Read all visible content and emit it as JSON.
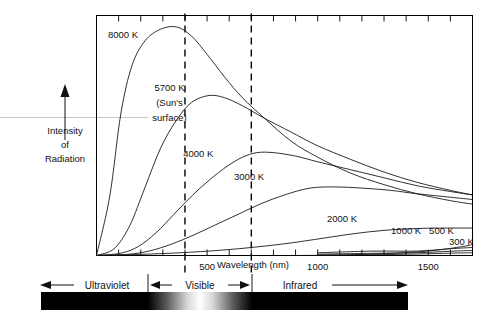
{
  "figure": {
    "y_axis_label_lines": [
      "Intensity",
      "of",
      "Radiation"
    ],
    "x_axis_label": "Wavelength (nm)"
  },
  "chart_data": {
    "type": "line",
    "title": "",
    "xlabel": "Wavelength (nm)",
    "ylabel": "Intensity of Radiation",
    "xlim": [
      0,
      1700
    ],
    "ylim": [
      0,
      1.05
    ],
    "grid": false,
    "legend": "inline-annotations",
    "x_ticks": [
      0,
      100,
      200,
      300,
      400,
      500,
      600,
      700,
      800,
      900,
      1000,
      1100,
      1200,
      1300,
      1400,
      1500,
      1600
    ],
    "x_tick_labels": [
      "",
      "",
      "",
      "",
      "",
      "500",
      "",
      "",
      "",
      "",
      "1000",
      "",
      "",
      "",
      "",
      "1500",
      ""
    ],
    "top_axis_ticks": true,
    "y_ticks": [],
    "visible_band_nm": [
      400,
      700
    ],
    "annotations": [
      {
        "text": "8000 K",
        "x_nm": 120,
        "y_rel": 0.95
      },
      {
        "text": "5700 K",
        "x_nm": 330,
        "y_rel": 0.72
      },
      {
        "text": "(Sun's",
        "x_nm": 330,
        "y_rel": 0.655
      },
      {
        "text": "surface)",
        "x_nm": 330,
        "y_rel": 0.59
      },
      {
        "text": "4000 K",
        "x_nm": 460,
        "y_rel": 0.43
      },
      {
        "text": "3000 K",
        "x_nm": 690,
        "y_rel": 0.33
      },
      {
        "text": "2000 K",
        "x_nm": 1110,
        "y_rel": 0.145
      },
      {
        "text": "1000 K",
        "x_nm": 1400,
        "y_rel": 0.095
      },
      {
        "text": "500 K",
        "x_nm": 1560,
        "y_rel": 0.095
      },
      {
        "text": "300 K",
        "x_nm": 1650,
        "y_rel": 0.045
      }
    ],
    "series": [
      {
        "name": "8000 K",
        "peak_nm": 362,
        "peak_rel": 1.0,
        "points": [
          [
            0,
            0.0
          ],
          [
            60,
            0.26
          ],
          [
            110,
            0.62
          ],
          [
            160,
            0.83
          ],
          [
            220,
            0.94
          ],
          [
            290,
            0.99
          ],
          [
            362,
            1.0
          ],
          [
            430,
            0.96
          ],
          [
            500,
            0.88
          ],
          [
            580,
            0.78
          ],
          [
            660,
            0.69
          ],
          [
            760,
            0.6
          ],
          [
            880,
            0.5
          ],
          [
            1000,
            0.43
          ],
          [
            1150,
            0.36
          ],
          [
            1300,
            0.31
          ],
          [
            1450,
            0.27
          ],
          [
            1600,
            0.24
          ],
          [
            1700,
            0.225
          ]
        ]
      },
      {
        "name": "5700 K",
        "peak_nm": 509,
        "peak_rel": 0.7,
        "points": [
          [
            0,
            0.0
          ],
          [
            80,
            0.03
          ],
          [
            150,
            0.13
          ],
          [
            220,
            0.3
          ],
          [
            290,
            0.47
          ],
          [
            360,
            0.59
          ],
          [
            430,
            0.67
          ],
          [
            509,
            0.7
          ],
          [
            580,
            0.69
          ],
          [
            660,
            0.655
          ],
          [
            760,
            0.6
          ],
          [
            880,
            0.54
          ],
          [
            1000,
            0.48
          ],
          [
            1150,
            0.42
          ],
          [
            1300,
            0.365
          ],
          [
            1450,
            0.32
          ],
          [
            1600,
            0.285
          ],
          [
            1700,
            0.265
          ]
        ]
      },
      {
        "name": "4000 K",
        "peak_nm": 725,
        "peak_rel": 0.45,
        "points": [
          [
            0,
            0.0
          ],
          [
            110,
            0.01
          ],
          [
            190,
            0.04
          ],
          [
            270,
            0.1
          ],
          [
            350,
            0.18
          ],
          [
            430,
            0.26
          ],
          [
            510,
            0.33
          ],
          [
            590,
            0.39
          ],
          [
            660,
            0.43
          ],
          [
            725,
            0.45
          ],
          [
            800,
            0.45
          ],
          [
            900,
            0.435
          ],
          [
            1000,
            0.41
          ],
          [
            1150,
            0.375
          ],
          [
            1300,
            0.34
          ],
          [
            1450,
            0.305
          ],
          [
            1600,
            0.28
          ],
          [
            1700,
            0.265
          ]
        ]
      },
      {
        "name": "3000 K",
        "peak_nm": 966,
        "peak_rel": 0.3,
        "points": [
          [
            0,
            0.0
          ],
          [
            140,
            0.005
          ],
          [
            240,
            0.02
          ],
          [
            340,
            0.05
          ],
          [
            440,
            0.09
          ],
          [
            540,
            0.135
          ],
          [
            640,
            0.18
          ],
          [
            740,
            0.225
          ],
          [
            850,
            0.265
          ],
          [
            966,
            0.295
          ],
          [
            1080,
            0.3
          ],
          [
            1200,
            0.295
          ],
          [
            1330,
            0.285
          ],
          [
            1450,
            0.27
          ],
          [
            1600,
            0.255
          ],
          [
            1700,
            0.245
          ]
        ]
      },
      {
        "name": "2000 K",
        "peak_nm": 1449,
        "peak_rel": 0.12,
        "points": [
          [
            0,
            0.0
          ],
          [
            200,
            0.005
          ],
          [
            380,
            0.012
          ],
          [
            560,
            0.023
          ],
          [
            720,
            0.037
          ],
          [
            880,
            0.055
          ],
          [
            1020,
            0.075
          ],
          [
            1160,
            0.095
          ],
          [
            1300,
            0.11
          ],
          [
            1449,
            0.118
          ],
          [
            1550,
            0.12
          ],
          [
            1700,
            0.12
          ]
        ]
      },
      {
        "name": "1000 K / 500 K / 300 K",
        "peak_nm": 1700,
        "peak_rel": 0.03,
        "points": [
          [
            900,
            0.0
          ],
          [
            1100,
            0.002
          ],
          [
            1300,
            0.008
          ],
          [
            1450,
            0.016
          ],
          [
            1560,
            0.026
          ],
          [
            1660,
            0.04
          ],
          [
            1700,
            0.048
          ]
        ]
      }
    ]
  },
  "spectrum_bar": {
    "bands": [
      {
        "name": "Ultraviolet",
        "label": "Ultraviolet",
        "arrow": "left",
        "color": "#000000"
      },
      {
        "name": "Visible",
        "label": "Visible",
        "arrow": "both",
        "color": "gradient-grayscale"
      },
      {
        "name": "Infrared",
        "label": "Infrared",
        "arrow": "right",
        "color": "#000000"
      }
    ]
  }
}
